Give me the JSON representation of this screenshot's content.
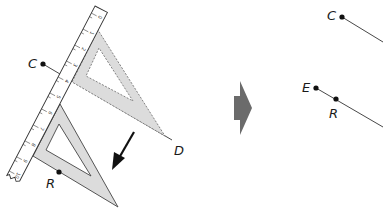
{
  "diagram": {
    "colors": {
      "line": "#1a1a1a",
      "set_square_fill": "#dcdcdc",
      "ruler_fill": "#ffffff",
      "transition_arrow": "#6b6b6b"
    },
    "left_panel": {
      "points": [
        {
          "label": "C",
          "x": 43,
          "y": 64
        },
        {
          "label": "D",
          "x": 172,
          "y": 140
        },
        {
          "label": "R",
          "x": 59,
          "y": 172
        }
      ],
      "ruler_ticks": [
        "0",
        "1",
        "2",
        "3",
        "4",
        "5",
        "6",
        "7",
        "8",
        "9",
        "10"
      ],
      "set_square_original": "dashed outline (before sliding)",
      "set_square_moved": "solid outline (after sliding)",
      "motion_arrow": "slide direction down-left"
    },
    "right_panel": {
      "points": [
        {
          "label": "C",
          "x": 342,
          "y": 17
        },
        {
          "label": "E",
          "x": 316,
          "y": 88
        },
        {
          "label": "R",
          "x": 336,
          "y": 99
        }
      ],
      "lines": [
        "CD",
        "ER"
      ]
    }
  }
}
